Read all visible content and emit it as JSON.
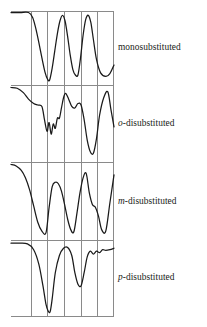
{
  "figure": {
    "kind": "infrared-spectra-comparison-figure",
    "background_color": "#ffffff",
    "trace_color": "#1a1a1a",
    "grid_color": "#8a8a8a",
    "frame_color": "#8a8a8a",
    "text_color": "#201c18"
  },
  "panels": [
    {
      "id": "monosubstituted",
      "prefix": "",
      "label": "monosubstituted"
    },
    {
      "id": "ortho-disubstituted",
      "prefix": "o",
      "label": "-disubstituted"
    },
    {
      "id": "meta-disubstituted",
      "prefix": "m",
      "label": "-disubstituted"
    },
    {
      "id": "para-disubstituted",
      "prefix": "p",
      "label": "-disubstituted"
    }
  ],
  "chart_data": {
    "type": "line",
    "title": "",
    "subtitle": "",
    "xlabel": "",
    "ylabel": "",
    "grid": true,
    "legend_position": "right",
    "panel_count": 4,
    "x_gridlines": [
      0,
      0.1942,
      0.3495,
      0.5146,
      0.6796,
      0.835,
      1.0
    ],
    "xlim": [
      0,
      1
    ],
    "ylim": [
      0,
      1
    ],
    "note": "Four stacked IR transmittance traces; y=1 is top (high transmittance), dips go downward. x is normalized across the shared frame.",
    "series": [
      {
        "name": "monosubstituted",
        "panel": 0,
        "x": [
          0.0,
          0.09,
          0.17,
          0.21,
          0.24,
          0.27,
          0.3,
          0.33,
          0.355,
          0.375,
          0.4,
          0.425,
          0.45,
          0.475,
          0.5,
          0.525,
          0.55,
          0.575,
          0.6,
          0.625,
          0.65,
          0.675,
          0.7,
          0.725,
          0.75,
          0.775,
          0.8,
          0.83,
          0.87,
          0.92,
          0.96,
          1.0
        ],
        "y": [
          1.0,
          1.0,
          1.0,
          0.93,
          0.78,
          0.58,
          0.36,
          0.16,
          0.06,
          0.05,
          0.22,
          0.46,
          0.7,
          0.88,
          0.96,
          0.88,
          0.66,
          0.4,
          0.2,
          0.12,
          0.12,
          0.36,
          0.68,
          0.9,
          0.96,
          0.86,
          0.62,
          0.34,
          0.15,
          0.1,
          0.14,
          0.26
        ]
      },
      {
        "name": "o-disubstituted",
        "panel": 1,
        "x": [
          0.0,
          0.06,
          0.12,
          0.17,
          0.22,
          0.26,
          0.3,
          0.325,
          0.35,
          0.37,
          0.39,
          0.41,
          0.43,
          0.45,
          0.47,
          0.49,
          0.51,
          0.53,
          0.56,
          0.59,
          0.62,
          0.65,
          0.68,
          0.71,
          0.74,
          0.77,
          0.8,
          0.83,
          0.86,
          0.9,
          0.94,
          0.97,
          1.0
        ],
        "y": [
          1.0,
          0.99,
          0.93,
          0.84,
          0.78,
          0.76,
          0.74,
          0.56,
          0.4,
          0.52,
          0.36,
          0.5,
          0.44,
          0.58,
          0.58,
          0.72,
          0.86,
          0.92,
          0.84,
          0.74,
          0.72,
          0.78,
          0.76,
          0.56,
          0.28,
          0.12,
          0.1,
          0.3,
          0.62,
          0.86,
          0.94,
          0.7,
          0.46
        ]
      },
      {
        "name": "m-disubstituted",
        "panel": 2,
        "x": [
          0.0,
          0.05,
          0.1,
          0.14,
          0.18,
          0.22,
          0.26,
          0.3,
          0.34,
          0.37,
          0.4,
          0.43,
          0.46,
          0.49,
          0.52,
          0.55,
          0.58,
          0.61,
          0.64,
          0.67,
          0.7,
          0.73,
          0.76,
          0.79,
          0.82,
          0.85,
          0.88,
          0.92,
          0.96,
          1.0
        ],
        "y": [
          1.0,
          0.98,
          0.92,
          0.82,
          0.66,
          0.44,
          0.22,
          0.1,
          0.08,
          0.42,
          0.7,
          0.76,
          0.74,
          0.64,
          0.46,
          0.26,
          0.12,
          0.09,
          0.34,
          0.62,
          0.82,
          0.88,
          0.62,
          0.46,
          0.42,
          0.3,
          0.12,
          0.1,
          0.48,
          0.86
        ]
      },
      {
        "name": "p-disubstituted",
        "panel": 3,
        "x": [
          0.0,
          0.08,
          0.16,
          0.22,
          0.27,
          0.31,
          0.34,
          0.36,
          0.38,
          0.4,
          0.43,
          0.47,
          0.51,
          0.55,
          0.59,
          0.62,
          0.65,
          0.68,
          0.71,
          0.74,
          0.77,
          0.8,
          0.83,
          0.86,
          0.89,
          0.92,
          0.96,
          1.0
        ],
        "y": [
          0.99,
          0.99,
          0.98,
          0.9,
          0.7,
          0.4,
          0.14,
          0.05,
          0.04,
          0.22,
          0.58,
          0.82,
          0.92,
          0.93,
          0.82,
          0.58,
          0.42,
          0.4,
          0.58,
          0.8,
          0.88,
          0.84,
          0.88,
          0.86,
          0.9,
          0.89,
          0.9,
          0.92
        ]
      }
    ]
  }
}
